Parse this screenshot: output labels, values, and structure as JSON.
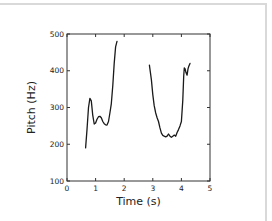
{
  "chart_data": {
    "type": "line",
    "title": "",
    "xlabel": "Time (s)",
    "ylabel": "Pitch (Hz)",
    "xlim": [
      0,
      5
    ],
    "ylim": [
      100,
      500
    ],
    "xticks": [
      0,
      1,
      2,
      3,
      4,
      5
    ],
    "yticks": [
      100,
      200,
      300,
      400,
      500
    ],
    "xtick_labels": [
      "0",
      "1",
      "2",
      "3",
      "4",
      "5"
    ],
    "ytick_labels": [
      "100",
      "200",
      "300",
      "400",
      "500"
    ],
    "grid": false,
    "legend": null,
    "line_color": "#1a1a1a",
    "series": [
      {
        "name": "segment-1",
        "x": [
          0.65,
          0.7,
          0.75,
          0.8,
          0.85,
          0.9,
          0.95,
          1.0,
          1.05,
          1.1,
          1.15,
          1.2,
          1.25,
          1.3,
          1.35,
          1.4,
          1.45,
          1.5,
          1.55,
          1.6,
          1.65,
          1.7,
          1.75
        ],
        "y": [
          190,
          240,
          300,
          325,
          318,
          280,
          255,
          258,
          268,
          275,
          276,
          272,
          262,
          256,
          253,
          252,
          262,
          285,
          310,
          360,
          420,
          465,
          480
        ]
      },
      {
        "name": "segment-2",
        "x": [
          2.88,
          2.95,
          3.0,
          3.05,
          3.1,
          3.15,
          3.2,
          3.25,
          3.3,
          3.35,
          3.4,
          3.45,
          3.5,
          3.55,
          3.6,
          3.65,
          3.7,
          3.75,
          3.8,
          3.85,
          3.9,
          3.95,
          4.0,
          4.05,
          4.08,
          4.1,
          4.13,
          4.16,
          4.2,
          4.23,
          4.26,
          4.3
        ],
        "y": [
          415,
          375,
          335,
          305,
          285,
          272,
          262,
          245,
          230,
          224,
          222,
          220,
          222,
          228,
          222,
          219,
          222,
          225,
          222,
          232,
          240,
          250,
          262,
          320,
          385,
          408,
          405,
          395,
          388,
          405,
          412,
          420
        ]
      }
    ]
  }
}
